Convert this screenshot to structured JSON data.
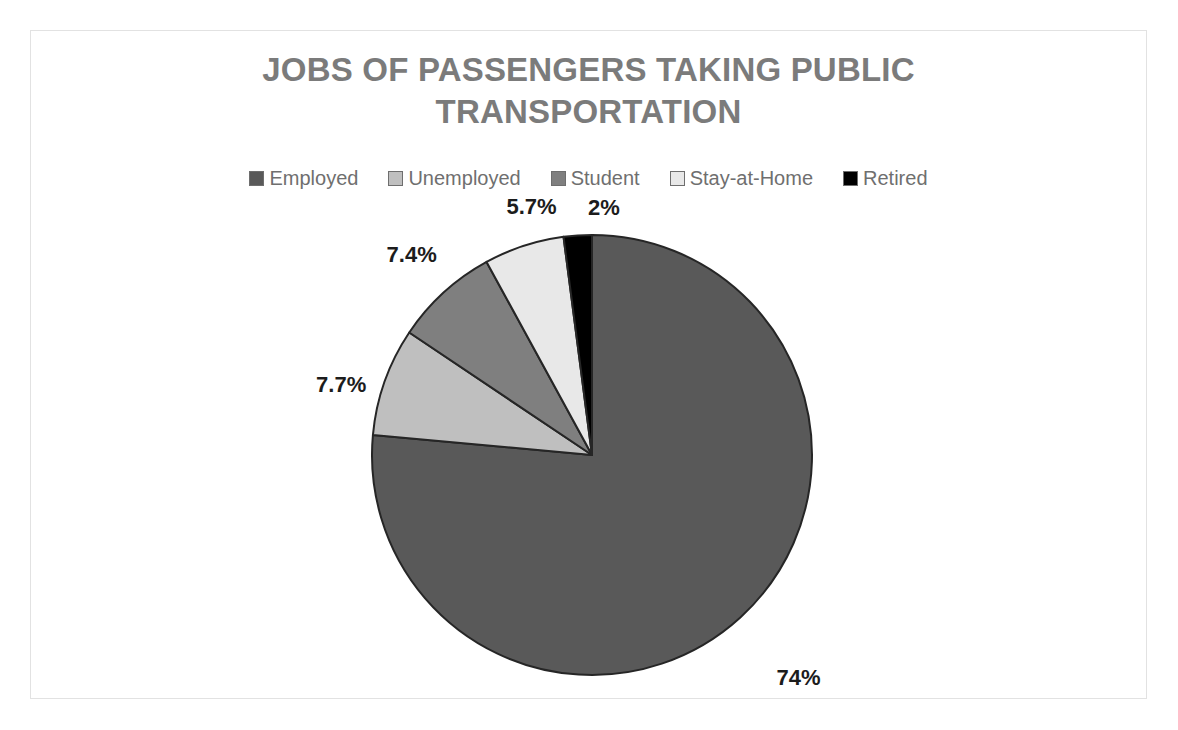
{
  "frame": {
    "border_color": "#e2e2e2",
    "background": "#ffffff"
  },
  "title": {
    "line1": "JOBS OF PASSENGERS TAKING PUBLIC",
    "line2": "TRANSPORTATION",
    "full": "JOBS OF PASSENGERS TAKING PUBLIC TRANSPORTATION",
    "color": "#7b7b7b"
  },
  "legend": {
    "position": "top",
    "items": [
      {
        "label": "Employed",
        "color": "#595959"
      },
      {
        "label": "Unemployed",
        "color": "#bfbfbf"
      },
      {
        "label": "Student",
        "color": "#7f7f7f"
      },
      {
        "label": "Stay-at-Home",
        "color": "#e8e8e8"
      },
      {
        "label": "Retired",
        "color": "#000000"
      }
    ]
  },
  "labels": {
    "employed": "74%",
    "unemployed": "7.7%",
    "student": "7.4%",
    "stay_at_home": "5.7%",
    "retired": "2%"
  },
  "chart_data": {
    "type": "pie",
    "title": "JOBS OF PASSENGERS TAKING PUBLIC TRANSPORTATION",
    "xlabel": "",
    "ylabel": "",
    "legend_position": "top",
    "grid": false,
    "start_angle_deg": 0,
    "direction": "clockwise",
    "units": "percent",
    "categories": [
      "Employed",
      "Unemployed",
      "Student",
      "Stay-at-Home",
      "Retired"
    ],
    "values": [
      74,
      7.7,
      7.4,
      5.7,
      2
    ],
    "data_labels": [
      "74%",
      "7.7%",
      "7.4%",
      "5.7%",
      "2%"
    ],
    "colors": [
      "#595959",
      "#bfbfbf",
      "#7f7f7f",
      "#e8e8e8",
      "#000000"
    ],
    "slice_border_color": "#262626",
    "center": {
      "x": 591,
      "y": 454
    },
    "radius": 220
  }
}
